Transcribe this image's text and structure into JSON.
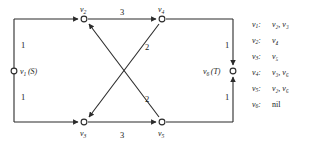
{
  "diagram": {
    "type": "flow-network-graph",
    "nodes": [
      {
        "id": "v1",
        "label": "v",
        "sub": "1",
        "annotation": "(S)",
        "x": 14,
        "y": 71,
        "label_side": "right"
      },
      {
        "id": "v2",
        "label": "v",
        "sub": "2",
        "annotation": "",
        "x": 84,
        "y": 19,
        "label_side": "above"
      },
      {
        "id": "v3",
        "label": "v",
        "sub": "3",
        "annotation": "",
        "x": 84,
        "y": 122,
        "label_side": "below"
      },
      {
        "id": "v4",
        "label": "v",
        "sub": "4",
        "annotation": "",
        "x": 162,
        "y": 19,
        "label_side": "above"
      },
      {
        "id": "v5",
        "label": "v",
        "sub": "5",
        "annotation": "",
        "x": 162,
        "y": 122,
        "label_side": "below"
      },
      {
        "id": "v6",
        "label": "v",
        "sub": "6",
        "annotation": "(T)",
        "x": 233,
        "y": 71,
        "label_side": "left"
      }
    ],
    "edges": [
      {
        "from": "v1",
        "to": "v2",
        "weight": "1",
        "label_x": 21,
        "label_y": 48
      },
      {
        "from": "v1",
        "to": "v3",
        "weight": "1",
        "label_x": 21,
        "label_y": 100
      },
      {
        "from": "v2",
        "to": "v4",
        "weight": "3",
        "label_x": 120,
        "label_y": 15
      },
      {
        "from": "v3",
        "to": "v5",
        "weight": "3",
        "label_x": 120,
        "label_y": 136
      },
      {
        "from": "v4",
        "to": "v3",
        "weight": "2",
        "label_x": 144,
        "label_y": 48
      },
      {
        "from": "v5",
        "to": "v2",
        "weight": "2",
        "label_x": 144,
        "label_y": 100
      },
      {
        "from": "v4",
        "to": "v6",
        "weight": "1",
        "label_x": 226,
        "label_y": 48
      },
      {
        "from": "v5",
        "to": "v6",
        "weight": "1",
        "label_x": 226,
        "label_y": 100
      }
    ]
  },
  "adjacency": {
    "rows": [
      {
        "key": "v",
        "key_sub": "1",
        "targets": "v₂, v₃",
        "targets_plain": [
          "v2",
          "v3"
        ],
        "is_nil": false
      },
      {
        "key": "v",
        "key_sub": "2",
        "targets": "v₄",
        "targets_plain": [
          "v4"
        ],
        "is_nil": false
      },
      {
        "key": "v",
        "key_sub": "3",
        "targets": "v₅",
        "targets_plain": [
          "v5"
        ],
        "is_nil": false
      },
      {
        "key": "v",
        "key_sub": "4",
        "targets": "v₃, v₆",
        "targets_plain": [
          "v3",
          "v6"
        ],
        "is_nil": false
      },
      {
        "key": "v",
        "key_sub": "5",
        "targets": "v₂, v₆",
        "targets_plain": [
          "v2",
          "v6"
        ],
        "is_nil": false
      },
      {
        "key": "v",
        "key_sub": "6",
        "targets": "nil",
        "targets_plain": [
          "nil"
        ],
        "is_nil": true
      }
    ]
  },
  "colors": {
    "line": "#2b2b2b",
    "text": "#1a1a1a",
    "background": "#ffffff"
  }
}
